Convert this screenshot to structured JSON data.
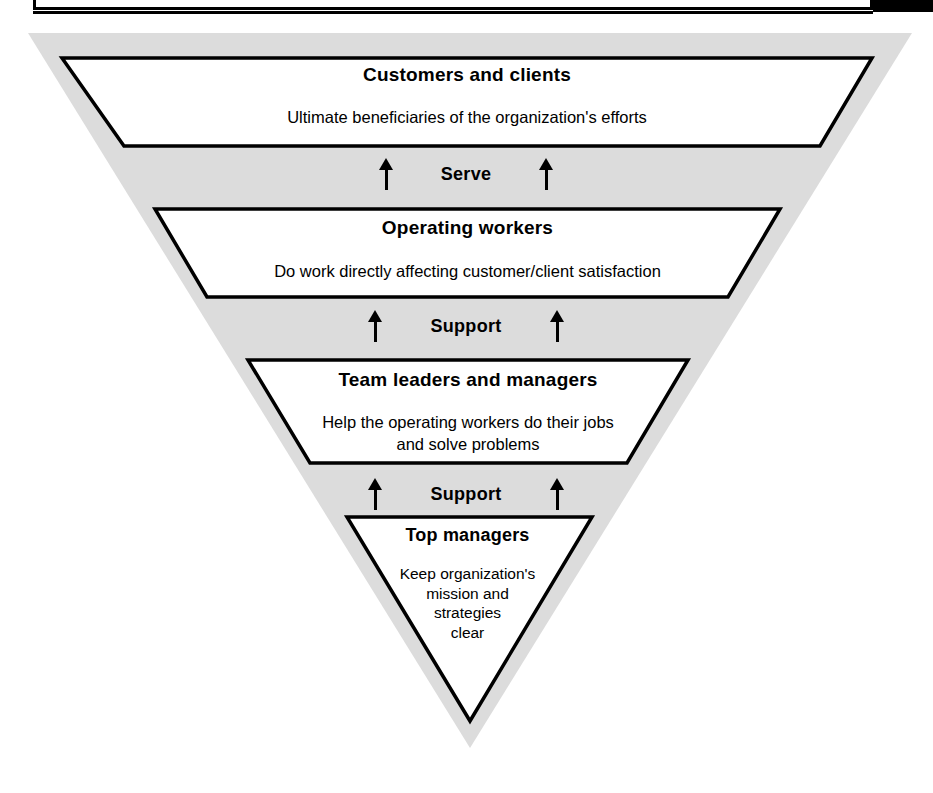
{
  "header": {
    "title": "THE 'UPSIDE-DOWN PYRAMID' VIEW OF ORGANIZATIONS",
    "has_black_marker": true
  },
  "diagram": {
    "type": "upside-down-pyramid",
    "orientation": "inverted",
    "outer_fill": "#dcdcdc",
    "tier_fill": "#ffffff",
    "stroke": "#000000",
    "tiers": [
      {
        "id": "customers-and-clients",
        "heading": "Customers and clients",
        "body": "Ultimate beneficiaries of the organization's efforts",
        "body_lines": [
          "Ultimate beneficiaries of the organization's efforts"
        ],
        "level": 1,
        "shape": "trapezoid"
      },
      {
        "id": "operating-workers",
        "heading": "Operating workers",
        "body": "Do work directly affecting customer/client satisfaction",
        "body_lines": [
          "Do work directly affecting customer/client satisfaction"
        ],
        "level": 2,
        "shape": "trapezoid"
      },
      {
        "id": "team-leaders-and-managers",
        "heading": "Team leaders and managers",
        "body": "Help the operating workers do their jobs and solve problems",
        "body_lines": [
          "Help the operating workers do their jobs",
          "and solve problems"
        ],
        "level": 3,
        "shape": "trapezoid"
      },
      {
        "id": "top-managers",
        "heading": "Top managers",
        "body": "Keep organization's mission and strategies clear",
        "body_lines": [
          "Keep organization's",
          "mission and",
          "strategies",
          "clear"
        ],
        "level": 4,
        "shape": "triangle"
      }
    ],
    "connectors": [
      {
        "id": "serve",
        "label": "Serve",
        "arrows": 2,
        "direction": "up",
        "between": [
          "operating-workers",
          "customers-and-clients"
        ]
      },
      {
        "id": "support-1",
        "label": "Support",
        "arrows": 2,
        "direction": "up",
        "between": [
          "team-leaders-and-managers",
          "operating-workers"
        ]
      },
      {
        "id": "support-2",
        "label": "Support",
        "arrows": 2,
        "direction": "up",
        "between": [
          "top-managers",
          "team-leaders-and-managers"
        ]
      }
    ]
  }
}
